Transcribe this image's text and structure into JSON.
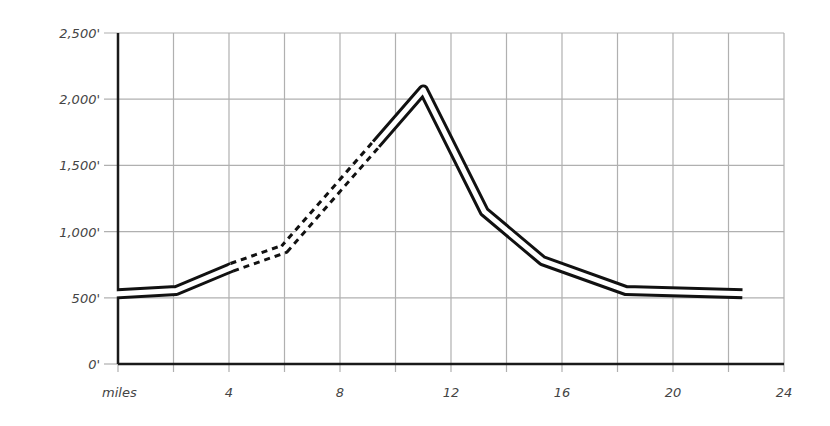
{
  "chart_data": {
    "type": "line",
    "title": "",
    "xlabel": "miles",
    "ylabel": "",
    "xlim": [
      0,
      24
    ],
    "ylim": [
      0,
      2500
    ],
    "grid": true,
    "x_ticks": [
      {
        "value": 4,
        "label": "4"
      },
      {
        "value": 8,
        "label": "8"
      },
      {
        "value": 12,
        "label": "12"
      },
      {
        "value": 16,
        "label": "16"
      },
      {
        "value": 20,
        "label": "20"
      },
      {
        "value": 24,
        "label": "24"
      }
    ],
    "x_unit_label": "miles",
    "y_ticks": [
      {
        "value": 0,
        "label": "0'"
      },
      {
        "value": 500,
        "label": "500'"
      },
      {
        "value": 1000,
        "label": "1,000'"
      },
      {
        "value": 1500,
        "label": "1,500'"
      },
      {
        "value": 2000,
        "label": "2,000'"
      },
      {
        "value": 2500,
        "label": "2,500'"
      }
    ],
    "series": [
      {
        "name": "road elevation profile",
        "style": "double line (solid, dashed between ~4 and ~9.3 miles)",
        "x": [
          0,
          2.1,
          4.1,
          6.0,
          9.3,
          11.0,
          13.2,
          15.3,
          18.3,
          22.5
        ],
        "y": [
          530,
          555,
          730,
          870,
          1660,
          2070,
          1150,
          780,
          555,
          530
        ],
        "segments": [
          {
            "from_x": 0,
            "to_x": 4.1,
            "style": "solid"
          },
          {
            "from_x": 4.1,
            "to_x": 9.3,
            "style": "dashed"
          },
          {
            "from_x": 9.3,
            "to_x": 22.5,
            "style": "solid"
          }
        ]
      }
    ]
  }
}
